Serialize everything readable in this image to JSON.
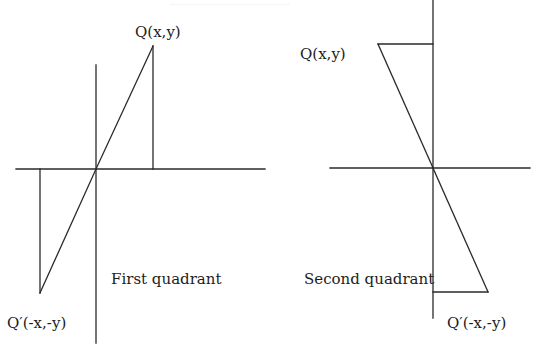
{
  "figure": {
    "left_panel": {
      "caption": "First quadrant",
      "point_q_label": "Q(x,y)",
      "point_q_prime_label": "Q′(-x,-y)"
    },
    "right_panel": {
      "caption": "Second quadrant",
      "point_q_label": "Q(x,y)",
      "point_q_prime_label": "Q′(-x,-y)"
    },
    "line_color": "#2a2a2a",
    "text_color": "#1c1c1c",
    "background": "#ffffff"
  }
}
